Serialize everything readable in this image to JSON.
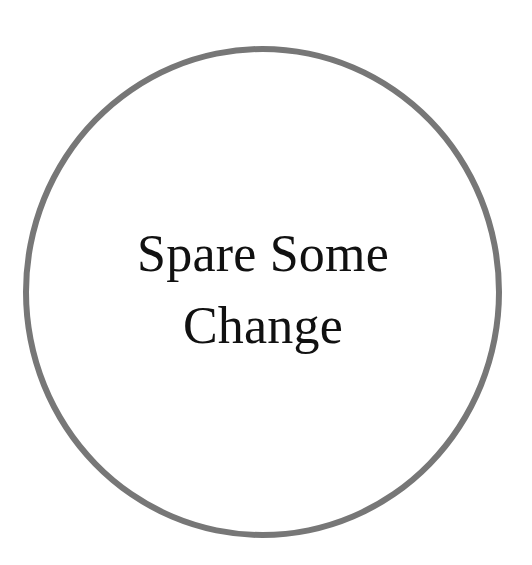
{
  "badge": {
    "lines": [
      "Spare Some",
      "Change"
    ],
    "ring_color": "#777777",
    "text_color": "#111111",
    "background": "#ffffff"
  }
}
